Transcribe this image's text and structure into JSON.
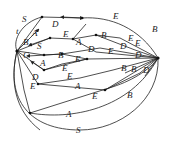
{
  "diagram": {
    "type": "directed-graph",
    "nodes": [
      {
        "id": "left",
        "x": 17,
        "y": 51
      },
      {
        "id": "right",
        "x": 158,
        "y": 58
      },
      {
        "id": "n1",
        "x": 42,
        "y": 17
      },
      {
        "id": "n2",
        "x": 82,
        "y": 18
      },
      {
        "id": "n3",
        "x": 50,
        "y": 38
      },
      {
        "id": "n4",
        "x": 73,
        "y": 39
      },
      {
        "id": "n5",
        "x": 96,
        "y": 35
      },
      {
        "id": "n6",
        "x": 44,
        "y": 55
      },
      {
        "id": "n7",
        "x": 62,
        "y": 54
      },
      {
        "id": "n8",
        "x": 44,
        "y": 70
      },
      {
        "id": "n9",
        "x": 87,
        "y": 59
      },
      {
        "id": "n10",
        "x": 38,
        "y": 84
      },
      {
        "id": "n11",
        "x": 109,
        "y": 88
      },
      {
        "id": "n12",
        "x": 30,
        "y": 113
      }
    ],
    "labels": [
      {
        "text": "S",
        "x": 22,
        "y": 22
      },
      {
        "text": "t",
        "x": 16,
        "y": 34
      },
      {
        "text": "D",
        "x": 52,
        "y": 27
      },
      {
        "text": "E",
        "x": 113,
        "y": 19
      },
      {
        "text": "B",
        "x": 152,
        "y": 32
      },
      {
        "text": "A",
        "x": 32,
        "y": 36
      },
      {
        "text": "E",
        "x": 63,
        "y": 37
      },
      {
        "text": "A",
        "x": 76,
        "y": 45
      },
      {
        "text": "B",
        "x": 101,
        "y": 38
      },
      {
        "text": "E",
        "x": 128,
        "y": 41
      },
      {
        "text": "B",
        "x": 23,
        "y": 45
      },
      {
        "text": "S",
        "x": 37,
        "y": 49
      },
      {
        "text": "D",
        "x": 88,
        "y": 52
      },
      {
        "text": "D",
        "x": 120,
        "y": 49
      },
      {
        "text": "E",
        "x": 108,
        "y": 54
      },
      {
        "text": "E",
        "x": 135,
        "y": 46
      },
      {
        "text": "C",
        "x": 23,
        "y": 58
      },
      {
        "text": "B",
        "x": 58,
        "y": 58
      },
      {
        "text": "D",
        "x": 135,
        "y": 58
      },
      {
        "text": "A",
        "x": 40,
        "y": 66
      },
      {
        "text": "E",
        "x": 62,
        "y": 71
      },
      {
        "text": "E",
        "x": 75,
        "y": 62
      },
      {
        "text": "B",
        "x": 121,
        "y": 71
      },
      {
        "text": "B",
        "x": 131,
        "y": 72
      },
      {
        "text": "D",
        "x": 143,
        "y": 73
      },
      {
        "text": "D",
        "x": 32,
        "y": 80
      },
      {
        "text": "E",
        "x": 67,
        "y": 79
      },
      {
        "text": "A",
        "x": 75,
        "y": 89
      },
      {
        "text": "E",
        "x": 30,
        "y": 89
      },
      {
        "text": "E",
        "x": 92,
        "y": 99
      },
      {
        "text": "B",
        "x": 127,
        "y": 98
      },
      {
        "text": "A",
        "x": 66,
        "y": 117
      },
      {
        "text": "S",
        "x": 76,
        "y": 133
      }
    ]
  }
}
